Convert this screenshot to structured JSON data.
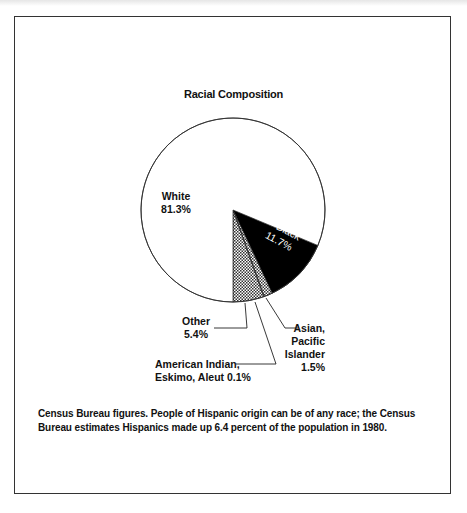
{
  "title": "Racial Composition",
  "chart_data": {
    "type": "pie",
    "title": "Racial Composition",
    "categories": [
      "White",
      "Black",
      "Asian, Pacific Islander",
      "American Indian, Eskimo, Aleut",
      "Other"
    ],
    "values": [
      81.3,
      11.7,
      1.5,
      0.1,
      5.4
    ],
    "unit": "%",
    "fills": [
      "white",
      "black",
      "crosshatch",
      "white",
      "crosshatch"
    ]
  },
  "labels": {
    "white_name": "White",
    "white_pct": "81.3%",
    "black_name": "Black",
    "black_pct": "11.7%",
    "other_name": "Other",
    "other_pct": "5.4%",
    "asian_line1": "Asian,",
    "asian_line2": "Pacific",
    "asian_line3": "Islander",
    "asian_pct": "1.5%",
    "amind_line1": "American Indian,",
    "amind_line2": "Eskimo, Aleut 0.1%"
  },
  "note": "Census Bureau figures. People of Hispanic origin can be of any race; the Census Bureau estimates Hispanics made up 6.4 percent of the population in 1980."
}
